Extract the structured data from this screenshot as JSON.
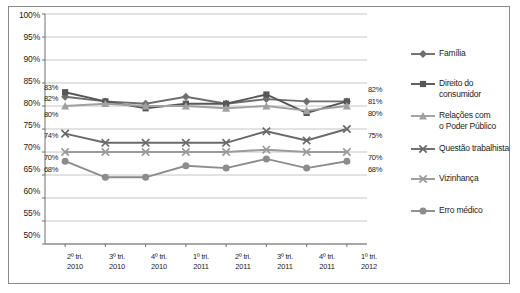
{
  "chart_data": {
    "type": "line",
    "title": "",
    "xlabel": "",
    "ylabel": "",
    "ylim": [
      50,
      100
    ],
    "ytick_step": 5,
    "grid": true,
    "legend_position": "right",
    "ytick_labels": [
      "100%",
      "95%",
      "90%",
      "85%",
      "80%",
      "75%",
      "70%",
      "65%",
      "60%",
      "55%",
      "50%"
    ],
    "categories": [
      "2º tri.\n2010",
      "3º tri.\n2010",
      "4º tri.\n2010",
      "1º tri.\n2011",
      "2º tri.\n2011",
      "3º tri.\n2011",
      "4º tri.\n2011",
      "1º tri.\n2012"
    ],
    "categories_top": [
      "2º tri.",
      "3º tri.",
      "4º tri.",
      "1º tri.",
      "2º tri.",
      "3º tri.",
      "4º tri.",
      "1º tri."
    ],
    "categories_bottom": [
      "2010",
      "2010",
      "2010",
      "2011",
      "2011",
      "2011",
      "2011",
      "2012"
    ],
    "series": [
      {
        "name": "Família",
        "marker": "diamond",
        "color": "#6e6e6e",
        "values": [
          82,
          81,
          80.5,
          82,
          80.5,
          81.5,
          81,
          81
        ]
      },
      {
        "name": "Direito do consumidor",
        "marker": "square",
        "color": "#575757",
        "values": [
          83,
          81,
          79.5,
          80.5,
          80.5,
          82.5,
          78.5,
          81
        ]
      },
      {
        "name": "Relações com o Poder Público",
        "marker": "triangle",
        "color": "#a0a0a0",
        "values": [
          80,
          80.5,
          80,
          80,
          79.5,
          80,
          79,
          80
        ]
      },
      {
        "name": "Questão trabalhista",
        "marker": "x",
        "color": "#6a6a6a",
        "values": [
          74,
          72,
          72,
          72,
          72,
          74.5,
          72.5,
          75
        ]
      },
      {
        "name": "Vizinhança",
        "marker": "x",
        "color": "#9a9a9a",
        "values": [
          70,
          70,
          70,
          70,
          70,
          70.5,
          70,
          70
        ]
      },
      {
        "name": "Erro médico",
        "marker": "circle",
        "color": "#8c8c8c",
        "values": [
          68,
          64.5,
          64.5,
          67,
          66.5,
          68.5,
          66.5,
          68
        ]
      }
    ],
    "left_labels": [
      "83%",
      "82%",
      "80%",
      "74%",
      "70%",
      "68%"
    ],
    "right_labels": [
      "82%",
      "81%",
      "80%",
      "75%",
      "70%",
      "68%"
    ]
  },
  "legend": {
    "items": [
      {
        "label": "Família",
        "marker": "diamond",
        "color": "#6e6e6e"
      },
      {
        "label": "Direito do\nconsumidor",
        "marker": "square",
        "color": "#575757"
      },
      {
        "label": "Relações com\no Poder Público",
        "marker": "triangle",
        "color": "#a0a0a0"
      },
      {
        "label": "Questão trabalhista",
        "marker": "x",
        "color": "#6a6a6a"
      },
      {
        "label": "Vizinhança",
        "marker": "x",
        "color": "#9a9a9a"
      },
      {
        "label": "Erro médico",
        "marker": "circle",
        "color": "#8c8c8c"
      }
    ]
  },
  "colors": {
    "border": "#8a8a8a",
    "grid": "#b8b8b8",
    "axis": "#6f6f6f",
    "text": "#1c1c1c",
    "background": "#ffffff"
  }
}
